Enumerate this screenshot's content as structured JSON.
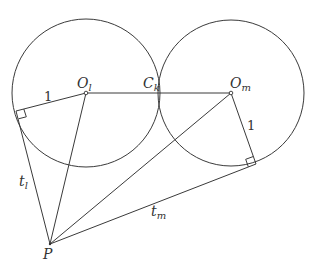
{
  "diagram": {
    "circles": [
      {
        "name": "circle-l",
        "cx": 86,
        "cy": 93,
        "r": 74
      },
      {
        "name": "circle-m",
        "cx": 231,
        "cy": 93,
        "r": 73
      }
    ],
    "points": {
      "O_l": {
        "x": 86,
        "y": 93
      },
      "C_k": {
        "x": 158,
        "y": 93
      },
      "O_m": {
        "x": 231,
        "y": 93
      },
      "T_l": {
        "x": 16,
        "y": 111
      },
      "T_m": {
        "x": 256,
        "y": 164
      },
      "P": {
        "x": 50,
        "y": 244
      }
    },
    "labels": {
      "O_l_main": "O",
      "O_l_sub": "l",
      "C_k_main": "C",
      "C_k_sub": "k",
      "O_m_main": "O",
      "O_m_sub": "m",
      "radius_l": "1",
      "radius_m": "1",
      "t_l_main": "t",
      "t_l_sub": "l",
      "t_m_main": "t",
      "t_m_sub": "m",
      "P": "P"
    }
  }
}
